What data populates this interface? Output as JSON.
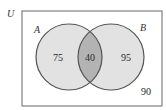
{
  "diagram": {
    "type": "venn",
    "universe": {
      "label": "U",
      "outside_count": "90"
    },
    "sets": [
      {
        "label": "A",
        "only_count": "75"
      },
      {
        "label": "B",
        "only_count": "95"
      }
    ],
    "intersection": {
      "label": "A∩B",
      "count": "40"
    },
    "colors": {
      "border": "#555555",
      "circle_fill": "#e2e2e2",
      "intersection_fill": "#b3b3b3",
      "background": "#ffffff"
    }
  }
}
